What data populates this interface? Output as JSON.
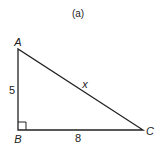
{
  "caption": "(a)",
  "triangle": {
    "vertices": {
      "A": {
        "label": "A"
      },
      "B": {
        "label": "B"
      },
      "C": {
        "label": "C"
      }
    },
    "sides": {
      "AB": {
        "label": "5"
      },
      "BC": {
        "label": "8"
      },
      "AC": {
        "label": "x"
      }
    },
    "right_angle_at": "B"
  },
  "colors": {
    "stroke": "#222222",
    "background": "#ffffff"
  }
}
